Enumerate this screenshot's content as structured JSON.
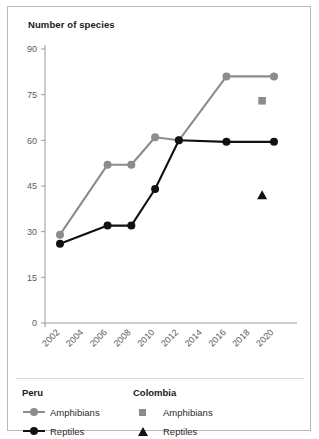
{
  "figure": {
    "title": "Number of species",
    "border_color": "#b9b9b9",
    "background": "#ffffff"
  },
  "colors": {
    "peru_amphibians": "#8c8c8c",
    "peru_reptiles": "#111111",
    "colombia_amphibians": "#8c8c8c",
    "colombia_reptiles": "#111111",
    "axis": "#9a9a9a",
    "tick_text": "#5b5b5b"
  },
  "legend": {
    "groups": [
      {
        "title": "Peru",
        "entries": [
          {
            "label": "Amphibians",
            "marker": "line-circle",
            "color": "#8c8c8c"
          },
          {
            "label": "Reptiles",
            "marker": "line-circle",
            "color": "#111111"
          }
        ]
      },
      {
        "title": "Colombia",
        "entries": [
          {
            "label": "Amphibians",
            "marker": "square",
            "color": "#8c8c8c"
          },
          {
            "label": "Reptiles",
            "marker": "triangle",
            "color": "#111111"
          }
        ]
      }
    ]
  },
  "chart_data": {
    "type": "line",
    "title": "Number of species",
    "xlabel": "",
    "ylabel": "Number of species",
    "xlim": [
      2001,
      2021
    ],
    "ylim": [
      0,
      93
    ],
    "grid": false,
    "legend_position": "bottom",
    "xticks": [
      "2002",
      "2004",
      "2006",
      "2008",
      "2010",
      "2012",
      "2014",
      "2016",
      "2018",
      "2020"
    ],
    "yticks": [
      "0",
      "15",
      "30",
      "45",
      "60",
      "75",
      "90"
    ],
    "series": [
      {
        "name": "Peru Amphibians",
        "group": "Peru",
        "marker": "circle",
        "style": "line",
        "color": "#8c8c8c",
        "x": [
          2002,
          2006,
          2008,
          2010,
          2012,
          2016,
          2020
        ],
        "values": [
          29,
          52,
          52,
          61,
          60,
          81,
          81
        ]
      },
      {
        "name": "Peru Reptiles",
        "group": "Peru",
        "marker": "circle",
        "style": "line",
        "color": "#111111",
        "x": [
          2002,
          2006,
          2008,
          2010,
          2012,
          2016,
          2020
        ],
        "values": [
          26,
          32,
          32,
          44,
          60,
          59.5,
          59.5
        ]
      },
      {
        "name": "Colombia Amphibians",
        "group": "Colombia",
        "marker": "square",
        "style": "point",
        "color": "#8c8c8c",
        "x": [
          2019
        ],
        "values": [
          73
        ]
      },
      {
        "name": "Colombia Reptiles",
        "group": "Colombia",
        "marker": "triangle",
        "style": "point",
        "color": "#111111",
        "x": [
          2019
        ],
        "values": [
          42
        ]
      }
    ]
  }
}
